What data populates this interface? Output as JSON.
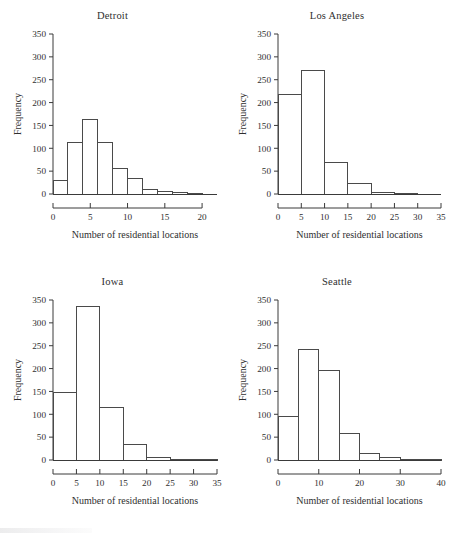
{
  "figure": {
    "layout": "2x2 grid of histograms",
    "background_color": "#ffffff",
    "axis_color": "#3a3a3a",
    "bar_stroke_color": "#4a4a4a",
    "bar_fill_color": "#ffffff"
  },
  "chart_data": [
    {
      "type": "bar",
      "title": "Detroit",
      "xlabel": "Number of residential locations",
      "ylabel": "Frequency",
      "xlim": [
        0,
        22
      ],
      "ylim": [
        0,
        350
      ],
      "xticks": [
        0,
        5,
        10,
        15,
        20
      ],
      "yticks": [
        0,
        50,
        100,
        150,
        200,
        250,
        300,
        350
      ],
      "grid": false,
      "legend": "none",
      "bin_width": 2,
      "bin_edges": [
        0,
        2,
        4,
        6,
        8,
        10,
        12,
        14,
        16,
        18,
        20,
        22
      ],
      "categories": [
        "0-2",
        "2-4",
        "4-6",
        "6-8",
        "8-10",
        "10-12",
        "12-14",
        "14-16",
        "16-18",
        "18-20",
        "20-22"
      ],
      "values": [
        30,
        112,
        162,
        113,
        56,
        35,
        10,
        6,
        3,
        1,
        0
      ]
    },
    {
      "type": "bar",
      "title": "Los Angeles",
      "xlabel": "Number of residential locations",
      "ylabel": "Frequency",
      "xlim": [
        0,
        35
      ],
      "ylim": [
        0,
        350
      ],
      "xticks": [
        0,
        5,
        10,
        15,
        20,
        25,
        30,
        35
      ],
      "yticks": [
        0,
        50,
        100,
        150,
        200,
        250,
        300,
        350
      ],
      "grid": false,
      "legend": "none",
      "bin_width": 5,
      "bin_edges": [
        0,
        5,
        10,
        15,
        20,
        25,
        30,
        35
      ],
      "categories": [
        "0-5",
        "5-10",
        "10-15",
        "15-20",
        "20-25",
        "25-30",
        "30-35"
      ],
      "values": [
        218,
        271,
        70,
        22,
        3,
        1,
        0
      ]
    },
    {
      "type": "bar",
      "title": "Iowa",
      "xlabel": "Number of residential locations",
      "ylabel": "Frequency",
      "xlim": [
        0,
        35
      ],
      "ylim": [
        0,
        350
      ],
      "xticks": [
        0,
        5,
        10,
        15,
        20,
        25,
        30,
        35
      ],
      "yticks": [
        0,
        50,
        100,
        150,
        200,
        250,
        300,
        350
      ],
      "grid": false,
      "legend": "none",
      "bin_width": 5,
      "bin_edges": [
        0,
        5,
        10,
        15,
        20,
        25,
        30,
        35
      ],
      "categories": [
        "0-5",
        "5-10",
        "10-15",
        "15-20",
        "20-25",
        "25-30",
        "30-35"
      ],
      "values": [
        147,
        335,
        115,
        34,
        5,
        1,
        1
      ]
    },
    {
      "type": "bar",
      "title": "Seattle",
      "xlabel": "Number of residential locations",
      "ylabel": "Frequency",
      "xlim": [
        0,
        40
      ],
      "ylim": [
        0,
        350
      ],
      "xticks": [
        0,
        10,
        20,
        30,
        40
      ],
      "yticks": [
        0,
        50,
        100,
        150,
        200,
        250,
        300,
        350
      ],
      "grid": false,
      "legend": "none",
      "bin_width": 5,
      "bin_edges": [
        0,
        5,
        10,
        15,
        20,
        25,
        30,
        35,
        40
      ],
      "categories": [
        "0-5",
        "5-10",
        "10-15",
        "15-20",
        "20-25",
        "25-30",
        "30-35",
        "35-40"
      ],
      "values": [
        96,
        241,
        195,
        58,
        15,
        6,
        1,
        1
      ]
    }
  ]
}
